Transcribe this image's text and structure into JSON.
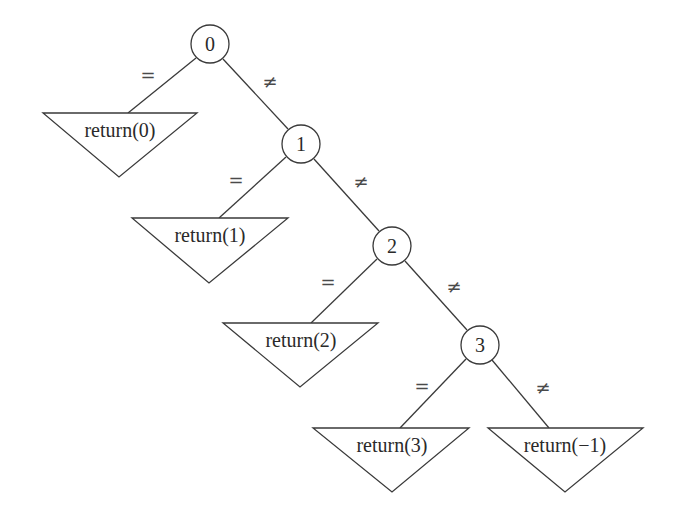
{
  "diagram": {
    "type": "decision-tree",
    "nodes": [
      {
        "id": "n0",
        "label": "0",
        "cx": 210,
        "cy": 44
      },
      {
        "id": "n1",
        "label": "1",
        "cx": 301,
        "cy": 144
      },
      {
        "id": "n2",
        "label": "2",
        "cx": 392,
        "cy": 246
      },
      {
        "id": "n3",
        "label": "3",
        "cx": 480,
        "cy": 345
      }
    ],
    "leaves": [
      {
        "id": "l0",
        "label": "return(0)"
      },
      {
        "id": "l1",
        "label": "return(1)"
      },
      {
        "id": "l2",
        "label": "return(2)"
      },
      {
        "id": "l3",
        "label": "return(3)"
      },
      {
        "id": "lm1",
        "label": "return(−1)"
      }
    ],
    "edges": [
      {
        "from": "0",
        "to": "return(0)",
        "label": "="
      },
      {
        "from": "0",
        "to": "1",
        "label": "≠"
      },
      {
        "from": "1",
        "to": "return(1)",
        "label": "="
      },
      {
        "from": "1",
        "to": "2",
        "label": "≠"
      },
      {
        "from": "2",
        "to": "return(2)",
        "label": "="
      },
      {
        "from": "2",
        "to": "3",
        "label": "≠"
      },
      {
        "from": "3",
        "to": "return(3)",
        "label": "="
      },
      {
        "from": "3",
        "to": "return(−1)",
        "label": "≠"
      }
    ]
  }
}
